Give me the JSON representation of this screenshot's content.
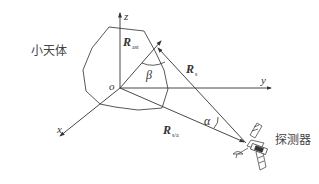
{
  "labels": {
    "body": "小天体",
    "probe": "探测器",
    "origin": "o",
    "axis_x": "x",
    "axis_y": "y",
    "axis_z": "z",
    "beta": "β",
    "alpha": "α"
  },
  "vectors": {
    "r_ast": {
      "main": "R",
      "sub": "ast"
    },
    "r_s": {
      "main": "R",
      "sub": "s"
    },
    "r_sa": {
      "main": "R",
      "sub": "s/a"
    }
  },
  "colors": {
    "line": "#333333",
    "text": "#333333"
  }
}
